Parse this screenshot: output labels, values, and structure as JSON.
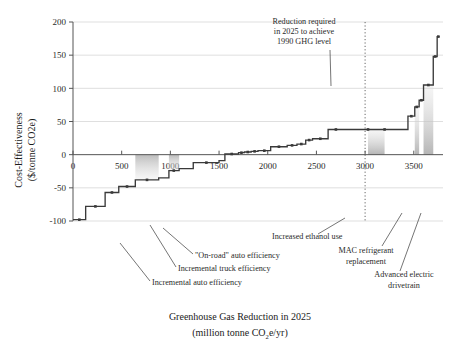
{
  "chart_data": {
    "type": "line",
    "title": "",
    "xlabel_line1": "Greenhouse Gas Reduction in 2025",
    "xlabel_line2_pre": "(million tonne CO",
    "xlabel_line2_sub": "2",
    "xlabel_line2_post": "e/yr)",
    "ylabel_line1": "Cost-Effectiveness",
    "ylabel_line2": "($/tonne CO2e)",
    "xlim": [
      0,
      3800
    ],
    "ylim": [
      -100,
      200
    ],
    "xticks": [
      0,
      500,
      1000,
      1500,
      2000,
      2500,
      3000,
      3500
    ],
    "xtick_labels": [
      "0",
      "500",
      "1000",
      "1500",
      "2000",
      "2500",
      "3000",
      "3500"
    ],
    "yticks": [
      -100,
      -50,
      0,
      50,
      100,
      150,
      200
    ],
    "ytick_labels": [
      "-100",
      "-50",
      "0",
      "50",
      "100",
      "150",
      "200"
    ],
    "grid": "horizontal",
    "legend": "none",
    "series": [
      {
        "name": "Marginal abatement cost curve",
        "style": "step",
        "color": "#3a3a3a",
        "steps": [
          {
            "x0": 0,
            "x1": 130,
            "y": -98
          },
          {
            "x0": 130,
            "x1": 330,
            "y": -78
          },
          {
            "x0": 330,
            "x1": 470,
            "y": -57
          },
          {
            "x0": 470,
            "x1": 640,
            "y": -48
          },
          {
            "x0": 640,
            "x1": 880,
            "y": -38
          },
          {
            "x0": 880,
            "x1": 985,
            "y": -35
          },
          {
            "x0": 985,
            "x1": 1090,
            "y": -24
          },
          {
            "x0": 1090,
            "x1": 1235,
            "y": -21
          },
          {
            "x0": 1235,
            "x1": 1500,
            "y": -12
          },
          {
            "x0": 1500,
            "x1": 1560,
            "y": -9
          },
          {
            "x0": 1560,
            "x1": 1700,
            "y": 1
          },
          {
            "x0": 1700,
            "x1": 1760,
            "y": 3
          },
          {
            "x0": 1760,
            "x1": 1830,
            "y": 4
          },
          {
            "x0": 1830,
            "x1": 1900,
            "y": 5
          },
          {
            "x0": 1900,
            "x1": 2030,
            "y": 6
          },
          {
            "x0": 2030,
            "x1": 2200,
            "y": 12
          },
          {
            "x0": 2200,
            "x1": 2300,
            "y": 14
          },
          {
            "x0": 2300,
            "x1": 2390,
            "y": 16
          },
          {
            "x0": 2390,
            "x1": 2460,
            "y": 22
          },
          {
            "x0": 2460,
            "x1": 2620,
            "y": 24
          },
          {
            "x0": 2620,
            "x1": 3440,
            "y": 38
          },
          {
            "x0": 3440,
            "x1": 3510,
            "y": 58
          },
          {
            "x0": 3510,
            "x1": 3555,
            "y": 72
          },
          {
            "x0": 3555,
            "x1": 3600,
            "y": 82
          },
          {
            "x0": 3600,
            "x1": 3700,
            "y": 105
          },
          {
            "x0": 3700,
            "x1": 3740,
            "y": 148
          },
          {
            "x0": 3740,
            "x1": 3765,
            "y": 178
          }
        ],
        "markers": [
          {
            "x": 65,
            "y": -98
          },
          {
            "x": 230,
            "y": -78
          },
          {
            "x": 400,
            "y": -57
          },
          {
            "x": 555,
            "y": -48
          },
          {
            "x": 760,
            "y": -38
          },
          {
            "x": 1035,
            "y": -24
          },
          {
            "x": 1370,
            "y": -12
          },
          {
            "x": 1630,
            "y": 1
          },
          {
            "x": 1730,
            "y": 3
          },
          {
            "x": 1795,
            "y": 4
          },
          {
            "x": 1865,
            "y": 5
          },
          {
            "x": 1965,
            "y": 6
          },
          {
            "x": 2115,
            "y": 12
          },
          {
            "x": 2250,
            "y": 14
          },
          {
            "x": 2345,
            "y": 16
          },
          {
            "x": 2425,
            "y": 22
          },
          {
            "x": 2540,
            "y": 24
          },
          {
            "x": 2700,
            "y": 38
          },
          {
            "x": 3030,
            "y": 38
          },
          {
            "x": 3200,
            "y": 38
          },
          {
            "x": 3475,
            "y": 58
          },
          {
            "x": 3530,
            "y": 72
          },
          {
            "x": 3578,
            "y": 82
          },
          {
            "x": 3650,
            "y": 105
          },
          {
            "x": 3720,
            "y": 148
          },
          {
            "x": 3752,
            "y": 178
          }
        ]
      }
    ],
    "shaded_bands": [
      {
        "name": "incremental-auto-efficiency",
        "x0": 640,
        "x1": 880,
        "y": -38
      },
      {
        "name": "incremental-truck-efficiency",
        "x0": 985,
        "x1": 1090,
        "y": -24
      },
      {
        "name": "increased-ethanol-use",
        "x0": 3030,
        "x1": 3200,
        "y": 38
      },
      {
        "name": "mac-refrigerant-replacement",
        "x0": 3510,
        "x1": 3555,
        "y": 72
      },
      {
        "name": "advanced-electric-drivetrain",
        "x0": 3600,
        "x1": 3700,
        "y": 105
      }
    ],
    "reference_line": {
      "name": "1990-ghg-level-target",
      "x": 3000,
      "style": "dotted"
    },
    "annotations": {
      "reduction_required": {
        "line1": "Reduction required",
        "line2": "in 2025 to achieve",
        "line3": "1990 GHG level"
      },
      "on_road_auto_efficiency": "\"On-road\" auto efficiency",
      "incremental_truck_efficiency": "Incremental truck efficiency",
      "incremental_auto_efficiency": "Incremental auto efficiency",
      "increased_ethanol_use": "Increased ethanol use",
      "mac_refrigerant": {
        "line1": "MAC refrigerant",
        "line2": "replacement"
      },
      "advanced_electric": {
        "line1": "Advanced electric",
        "line2": "drivetrain"
      }
    },
    "colors": {
      "curve": "#3a3a3a",
      "grid": "#c9c9c9",
      "axis": "#555555",
      "band": "#bdbdbd",
      "text": "#1a1a1a"
    }
  }
}
